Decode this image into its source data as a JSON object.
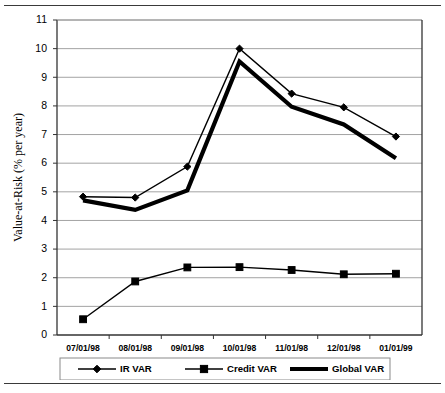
{
  "chart_data": {
    "type": "line",
    "title": "",
    "xlabel": "",
    "ylabel": "Value-at-Risk  (% per year)",
    "categories": [
      "07/01/98",
      "08/01/98",
      "09/01/98",
      "10/01/98",
      "11/01/98",
      "12/01/98",
      "01/01/99"
    ],
    "ylim": [
      0,
      11
    ],
    "ytick_step": 1,
    "yticks": [
      "0",
      "1",
      "2",
      "3",
      "4",
      "5",
      "6",
      "7",
      "8",
      "9",
      "10",
      "11"
    ],
    "grid": true,
    "legend_position": "bottom",
    "series": [
      {
        "name": "IR VAR",
        "marker": "diamond",
        "line_weight": "thin",
        "color": "#000000",
        "values": [
          4.83,
          4.8,
          5.88,
          10.0,
          8.43,
          7.95,
          6.93
        ]
      },
      {
        "name": "Credit VAR",
        "marker": "square",
        "line_weight": "thin",
        "color": "#000000",
        "values": [
          0.55,
          1.87,
          2.36,
          2.37,
          2.27,
          2.12,
          2.14
        ]
      },
      {
        "name": "Global VAR",
        "marker": "none",
        "line_weight": "thick",
        "color": "#000000",
        "values": [
          4.7,
          4.37,
          5.05,
          9.55,
          7.97,
          7.35,
          6.17
        ]
      }
    ]
  },
  "legend": {
    "entries": [
      "IR VAR",
      "Credit VAR",
      "Global VAR"
    ]
  },
  "figure": {
    "top_rule": "",
    "bottom_rule": ""
  }
}
